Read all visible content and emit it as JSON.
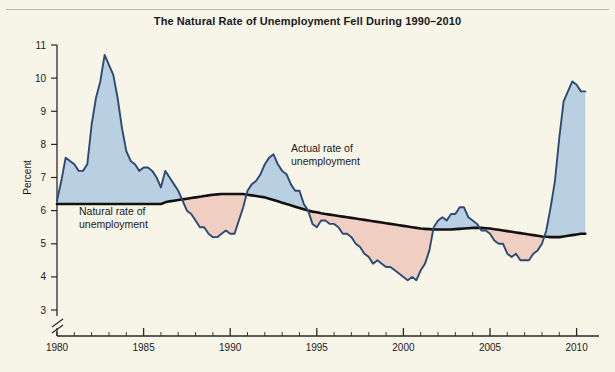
{
  "figure": {
    "title": "The Natural Rate of Unemployment Fell During 1990–2010",
    "background_color": "#f7f4e8",
    "frame_color": "#b9b4a0"
  },
  "annotations": {
    "actual_line1": "Actual rate of",
    "actual_line2": "unemployment",
    "natural_line1": "Natural rate of",
    "natural_line2": "unemployment"
  },
  "colors": {
    "above_fill": "#b9cfe2",
    "below_fill": "#f0cfc2",
    "actual_line": "#2d4a70",
    "natural_line": "#111111",
    "axis": "#2a2a2a",
    "text": "#1a1a1a"
  },
  "chart_data": {
    "type": "area",
    "title": "The Natural Rate of Unemployment Fell During 1990–2010",
    "xlabel": "",
    "ylabel": "Percent",
    "xlim": [
      1980,
      2010.6
    ],
    "ylim": [
      3,
      11
    ],
    "yticks": [
      3,
      4,
      5,
      6,
      7,
      8,
      9,
      10,
      11
    ],
    "xticks": [
      1980,
      1985,
      1990,
      1995,
      2000,
      2005,
      2010
    ],
    "xtick_labels": [
      "1980",
      "1985",
      "1990",
      "1995",
      "2000",
      "2005",
      "2010"
    ],
    "minor_xtick_interval": 1,
    "y_axis_break": true,
    "grid": false,
    "legend": "annotations-inline",
    "fill_rules": {
      "actual_above_natural": "#b9cfe2",
      "actual_below_natural": "#f0cfc2"
    },
    "x": [
      1980.0,
      1980.25,
      1980.5,
      1980.75,
      1981.0,
      1981.25,
      1981.5,
      1981.75,
      1982.0,
      1982.25,
      1982.5,
      1982.75,
      1983.0,
      1983.25,
      1983.5,
      1983.75,
      1984.0,
      1984.25,
      1984.5,
      1984.75,
      1985.0,
      1985.25,
      1985.5,
      1985.75,
      1986.0,
      1986.25,
      1986.5,
      1986.75,
      1987.0,
      1987.25,
      1987.5,
      1987.75,
      1988.0,
      1988.25,
      1988.5,
      1988.75,
      1989.0,
      1989.25,
      1989.5,
      1989.75,
      1990.0,
      1990.25,
      1990.5,
      1990.75,
      1991.0,
      1991.25,
      1991.5,
      1991.75,
      1992.0,
      1992.25,
      1992.5,
      1992.75,
      1993.0,
      1993.25,
      1993.5,
      1993.75,
      1994.0,
      1994.25,
      1994.5,
      1994.75,
      1995.0,
      1995.25,
      1995.5,
      1995.75,
      1996.0,
      1996.25,
      1996.5,
      1996.75,
      1997.0,
      1997.25,
      1997.5,
      1997.75,
      1998.0,
      1998.25,
      1998.5,
      1998.75,
      1999.0,
      1999.25,
      1999.5,
      1999.75,
      2000.0,
      2000.25,
      2000.5,
      2000.75,
      2001.0,
      2001.25,
      2001.5,
      2001.75,
      2002.0,
      2002.25,
      2002.5,
      2002.75,
      2003.0,
      2003.25,
      2003.5,
      2003.75,
      2004.0,
      2004.25,
      2004.5,
      2004.75,
      2005.0,
      2005.25,
      2005.5,
      2005.75,
      2006.0,
      2006.25,
      2006.5,
      2006.75,
      2007.0,
      2007.25,
      2007.5,
      2007.75,
      2008.0,
      2008.25,
      2008.5,
      2008.75,
      2009.0,
      2009.25,
      2009.5,
      2009.75,
      2010.0,
      2010.25,
      2010.5
    ],
    "series": [
      {
        "name": "Actual rate of unemployment",
        "color": "#2d4a70",
        "values": [
          6.3,
          6.9,
          7.6,
          7.5,
          7.4,
          7.2,
          7.2,
          7.4,
          8.6,
          9.4,
          9.9,
          10.7,
          10.4,
          10.1,
          9.4,
          8.5,
          7.8,
          7.5,
          7.4,
          7.2,
          7.3,
          7.3,
          7.2,
          7.0,
          6.7,
          7.2,
          7.0,
          6.8,
          6.6,
          6.3,
          6.0,
          5.9,
          5.7,
          5.5,
          5.5,
          5.3,
          5.2,
          5.2,
          5.3,
          5.4,
          5.3,
          5.3,
          5.7,
          6.1,
          6.6,
          6.8,
          6.9,
          7.1,
          7.4,
          7.6,
          7.7,
          7.4,
          7.2,
          7.1,
          6.8,
          6.6,
          6.6,
          6.2,
          6.0,
          5.6,
          5.5,
          5.7,
          5.7,
          5.6,
          5.6,
          5.5,
          5.3,
          5.3,
          5.2,
          5.0,
          4.9,
          4.7,
          4.6,
          4.4,
          4.5,
          4.4,
          4.3,
          4.3,
          4.2,
          4.1,
          4.0,
          3.9,
          4.0,
          3.9,
          4.2,
          4.4,
          4.8,
          5.5,
          5.7,
          5.8,
          5.7,
          5.9,
          5.9,
          6.1,
          6.1,
          5.8,
          5.7,
          5.6,
          5.4,
          5.4,
          5.3,
          5.1,
          5.0,
          5.0,
          4.7,
          4.6,
          4.7,
          4.5,
          4.5,
          4.5,
          4.7,
          4.8,
          5.0,
          5.4,
          6.1,
          6.9,
          8.2,
          9.3,
          9.6,
          9.9,
          9.8,
          9.6,
          9.6
        ]
      },
      {
        "name": "Natural rate of unemployment",
        "color": "#111111",
        "values": [
          6.2,
          6.2,
          6.2,
          6.2,
          6.2,
          6.2,
          6.2,
          6.2,
          6.2,
          6.2,
          6.2,
          6.2,
          6.2,
          6.2,
          6.2,
          6.2,
          6.2,
          6.2,
          6.2,
          6.2,
          6.2,
          6.2,
          6.2,
          6.2,
          6.2,
          6.25,
          6.28,
          6.3,
          6.32,
          6.34,
          6.36,
          6.38,
          6.4,
          6.42,
          6.44,
          6.46,
          6.48,
          6.49,
          6.5,
          6.5,
          6.5,
          6.5,
          6.5,
          6.5,
          6.48,
          6.46,
          6.44,
          6.42,
          6.4,
          6.36,
          6.32,
          6.28,
          6.24,
          6.2,
          6.16,
          6.12,
          6.08,
          6.04,
          6.0,
          5.97,
          5.95,
          5.92,
          5.9,
          5.88,
          5.86,
          5.84,
          5.82,
          5.8,
          5.78,
          5.76,
          5.74,
          5.72,
          5.7,
          5.68,
          5.66,
          5.64,
          5.62,
          5.6,
          5.58,
          5.56,
          5.54,
          5.52,
          5.5,
          5.48,
          5.46,
          5.45,
          5.44,
          5.43,
          5.43,
          5.43,
          5.43,
          5.43,
          5.44,
          5.45,
          5.46,
          5.47,
          5.48,
          5.48,
          5.48,
          5.47,
          5.46,
          5.44,
          5.42,
          5.4,
          5.38,
          5.36,
          5.34,
          5.32,
          5.3,
          5.28,
          5.26,
          5.24,
          5.22,
          5.21,
          5.2,
          5.2,
          5.2,
          5.22,
          5.24,
          5.26,
          5.28,
          5.3,
          5.3
        ]
      }
    ]
  }
}
